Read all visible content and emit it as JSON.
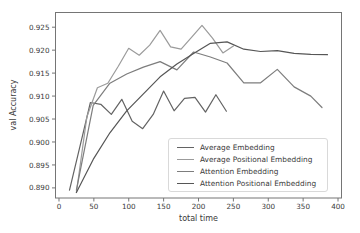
{
  "figure": {
    "background": "#ffffff",
    "text_color": "#3a3a3a",
    "spine_color": "#757575"
  },
  "chart_data": {
    "type": "line",
    "title": "",
    "xlabel": "total time",
    "ylabel": "val Accuracy",
    "xlim": [
      -5,
      405
    ],
    "ylim": [
      0.8878,
      0.9282
    ],
    "x_ticks": [
      0,
      50,
      100,
      150,
      200,
      250,
      300,
      350,
      400
    ],
    "y_ticks": [
      0.89,
      0.895,
      0.9,
      0.905,
      0.91,
      0.915,
      0.92,
      0.925
    ],
    "grid": false,
    "legend_position": "lower-right-inside",
    "series": [
      {
        "name": "Average Embedding",
        "color": "#636363",
        "x": [
          15,
          30,
          45,
          60,
          75,
          90,
          105,
          120,
          135,
          150,
          165,
          180,
          195,
          210,
          225,
          240
        ],
        "y": [
          0.8895,
          0.899,
          0.9086,
          0.9082,
          0.906,
          0.9093,
          0.9045,
          0.9029,
          0.906,
          0.9111,
          0.9068,
          0.9095,
          0.9097,
          0.9065,
          0.9103,
          0.9067
        ]
      },
      {
        "name": "Average Positional Embedding",
        "color": "#9b9b9b",
        "x": [
          25,
          40,
          55,
          70,
          85,
          100,
          115,
          130,
          145,
          160,
          175,
          190,
          205,
          220,
          235,
          250
        ],
        "y": [
          0.889,
          0.9055,
          0.9118,
          0.9128,
          0.9165,
          0.9204,
          0.9189,
          0.9211,
          0.9243,
          0.9207,
          0.9202,
          0.9228,
          0.9254,
          0.9226,
          0.9194,
          0.9209
        ]
      },
      {
        "name": "Attention Embedding",
        "color": "#7d7d7d",
        "x": [
          25,
          49,
          73,
          97,
          121,
          145,
          169,
          193,
          217,
          241,
          265,
          289,
          313,
          337,
          361,
          377
        ],
        "y": [
          0.8895,
          0.908,
          0.9128,
          0.9148,
          0.9163,
          0.9175,
          0.9157,
          0.9196,
          0.9185,
          0.9172,
          0.9129,
          0.9129,
          0.9158,
          0.912,
          0.91,
          0.9075
        ]
      },
      {
        "name": "Attention Positional Embedding",
        "color": "#565656",
        "x": [
          25,
          49,
          73,
          97,
          121,
          145,
          169,
          193,
          217,
          241,
          265,
          289,
          313,
          337,
          361,
          385
        ],
        "y": [
          0.889,
          0.8962,
          0.902,
          0.9068,
          0.9105,
          0.9142,
          0.917,
          0.9193,
          0.9215,
          0.9218,
          0.9202,
          0.9197,
          0.9199,
          0.9193,
          0.9191,
          0.919
        ]
      }
    ]
  }
}
